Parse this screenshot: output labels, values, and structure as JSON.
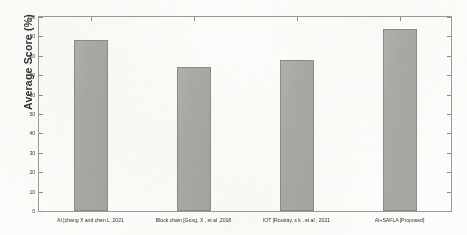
{
  "chart_data": {
    "type": "bar",
    "title": "",
    "xlabel": "",
    "ylabel": "Average Score (%)",
    "ylim": [
      0,
      100
    ],
    "yticks": [
      0,
      10,
      20,
      30,
      40,
      50,
      60,
      70,
      80,
      90,
      100
    ],
    "grid": false,
    "legend": null,
    "categories": [
      "AI [chang X and chen L ,2021",
      "Block chain [Gong, X , et al ,2018",
      "IOT [Routray, s k , et al , 2021",
      "AI+SAFLA [Proposed]"
    ],
    "values": [
      88,
      74,
      78,
      94
    ],
    "bar_color": "#a9a9a5",
    "bar_edge_color": "#8a8a86"
  },
  "axes": {
    "y_title": "Average Score (%)",
    "y_tick_labels": [
      "0",
      "10",
      "20",
      "30",
      "40",
      "50",
      "60",
      "70",
      "80",
      "90",
      "100"
    ]
  },
  "colors": {
    "page_background": "#fdfdfb",
    "axis_line": "#9a9a96",
    "tick": "#8d8d89",
    "text": "#333333",
    "bar_fill": "#a9a9a5",
    "bar_edge": "#8a8a86"
  }
}
